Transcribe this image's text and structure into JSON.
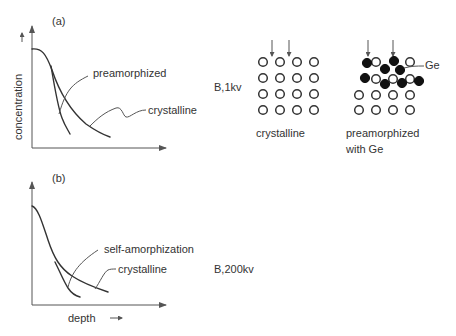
{
  "panels": {
    "a": {
      "label": "(a)",
      "y_axis_label": "concentration",
      "curve_labels": {
        "preamorphized": "preamorphized",
        "crystalline": "crystalline"
      },
      "condition": "B,1kv"
    },
    "b": {
      "label": "(b)",
      "x_axis_label": "depth",
      "curve_labels": {
        "self_amorphization": "self-amorphization",
        "crystalline": "crystalline"
      },
      "condition": "B,200kv"
    }
  },
  "lattices": {
    "crystalline": {
      "caption": "crystalline",
      "rows": 4,
      "cols": 4
    },
    "preamorphized": {
      "caption_line1": "preamorphized",
      "caption_line2": "with Ge",
      "ge_label": "Ge"
    }
  },
  "colors": {
    "ink": "#333333",
    "ge_atom": "#111111",
    "background": "#ffffff"
  }
}
